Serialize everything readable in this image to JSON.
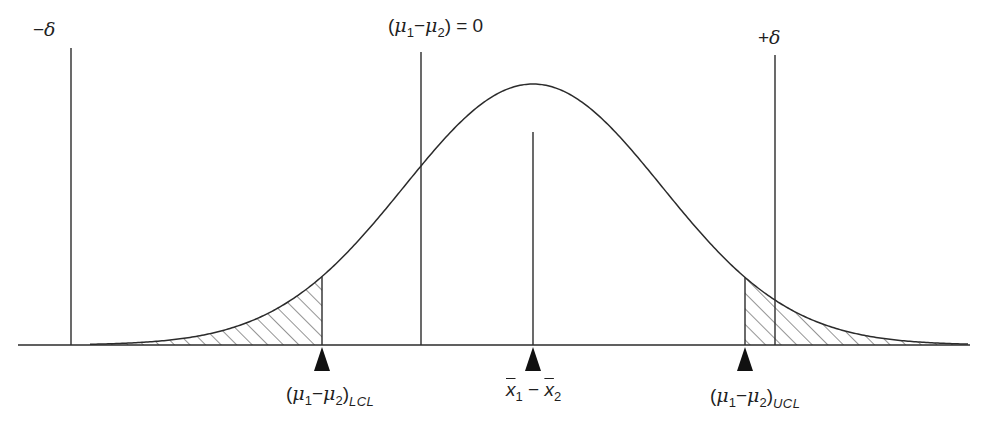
{
  "diagram": {
    "title": "",
    "type": "normal-distribution-equivalence-test",
    "colors": {
      "line": "#2b2b2b",
      "hatch": "#3a3a3a",
      "marker": "#111111",
      "background": "#ffffff"
    },
    "top_labels": {
      "minus_delta": {
        "sign": "−",
        "symbol": "δ"
      },
      "null_hypothesis": {
        "open": "(",
        "mu": "μ",
        "sub1": "1",
        "minus": "−",
        "sub2": "2",
        "close": ")",
        "equals": " = 0"
      },
      "plus_delta": {
        "sign": "+",
        "symbol": "δ"
      }
    },
    "bottom_labels": {
      "lcl": {
        "open": "(",
        "mu": "μ",
        "sub1": "1",
        "minus": "−",
        "sub2": "2",
        "close": ")",
        "subscript": "LCL"
      },
      "center": {
        "x": "x",
        "sub1": "1",
        "minus": " − ",
        "sub2": "2"
      },
      "ucl": {
        "open": "(",
        "mu": "μ",
        "sub1": "1",
        "minus": "−",
        "sub2": "2",
        "close": ")",
        "subscript": "UCL"
      }
    },
    "geometry": {
      "baseline_y": 345,
      "baseline_x_start": 18,
      "baseline_x_end": 970,
      "curve_mean_x": 533,
      "curve_peak_y": 84,
      "curve_sigma_px": 129,
      "lines": {
        "minus_delta_x": 71,
        "null_x": 421,
        "center_x": 533,
        "plus_delta_x": 775,
        "lcl_x": 322,
        "ucl_x": 745
      }
    },
    "markers": [
      {
        "name": "lcl-marker",
        "x": 322
      },
      {
        "name": "center-marker",
        "x": 533
      },
      {
        "name": "ucl-marker",
        "x": 745
      }
    ]
  }
}
